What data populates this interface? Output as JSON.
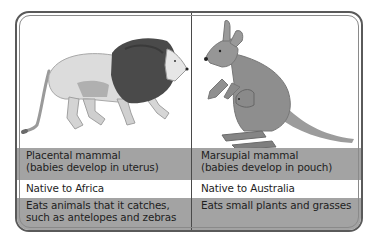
{
  "colors": {
    "border": "#5a5a5a",
    "shaded_row": "#a3a3a3",
    "plain_row": "#ffffff",
    "text": "#1e1e1e"
  },
  "columns": [
    {
      "animal": "Lion",
      "icon": "lion-illustration",
      "rows": {
        "type_line1": "Placental mammal",
        "type_line2": "(babies develop in uterus)",
        "native": "Native to Africa",
        "diet_line1": "Eats animals that it catches,",
        "diet_line2": "such as antelopes and zebras"
      }
    },
    {
      "animal": "Kangaroo",
      "icon": "kangaroo-illustration",
      "rows": {
        "type_line1": "Marsupial mammal",
        "type_line2": "(babies develop in pouch)",
        "native": "Native to Australia",
        "diet_line1": "Eats small plants and grasses",
        "diet_line2": ""
      }
    }
  ]
}
